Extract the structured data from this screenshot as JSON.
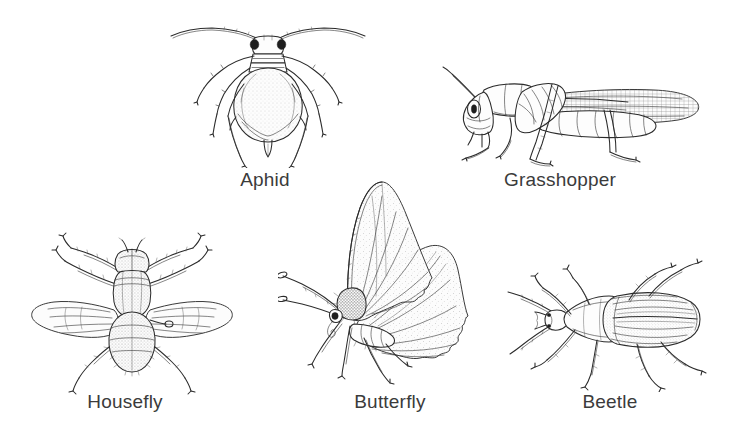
{
  "figure": {
    "background_color": "#ffffff",
    "ink_color": "#2b2b2b",
    "caption_color": "#3b3b3b",
    "width": 756,
    "height": 442,
    "style": "black and white pen-and-ink scientific illustration"
  },
  "specimens": [
    {
      "id": "aphid",
      "label": "Aphid",
      "view": "dorsal",
      "orientation": "head-up",
      "icon": "aphid-icon",
      "row": 1,
      "column": 1,
      "features": "long swept antennae, dark eyes, pear-shaped stippled abdomen, cornicles, six slender legs"
    },
    {
      "id": "grasshopper",
      "label": "Grasshopper",
      "view": "lateral",
      "orientation": "facing-left",
      "icon": "grasshopper-icon",
      "row": 1,
      "column": 2,
      "features": "long folded forewing, large hind femur, segmented abdomen, single long antenna"
    },
    {
      "id": "housefly",
      "label": "Housefly",
      "view": "dorsal",
      "orientation": "head-up",
      "icon": "housefly-icon",
      "row": 2,
      "column": 1,
      "features": "two outspread veined wings, striped thorax, stippled abdomen, six bristled legs"
    },
    {
      "id": "butterfly",
      "label": "Butterfly",
      "view": "lateral",
      "orientation": "facing-left",
      "icon": "butterfly-icon",
      "row": 2,
      "column": 2,
      "features": "wings held closed upright, veined forewing and hindwing, clubbed antennae, furry thorax"
    },
    {
      "id": "beetle",
      "label": "Beetle",
      "view": "dorsal",
      "orientation": "facing-left",
      "icon": "beetle-icon",
      "row": 2,
      "column": 3,
      "features": "ridged striated elytra, triangular pronotum, long antennae, spined legs"
    }
  ]
}
